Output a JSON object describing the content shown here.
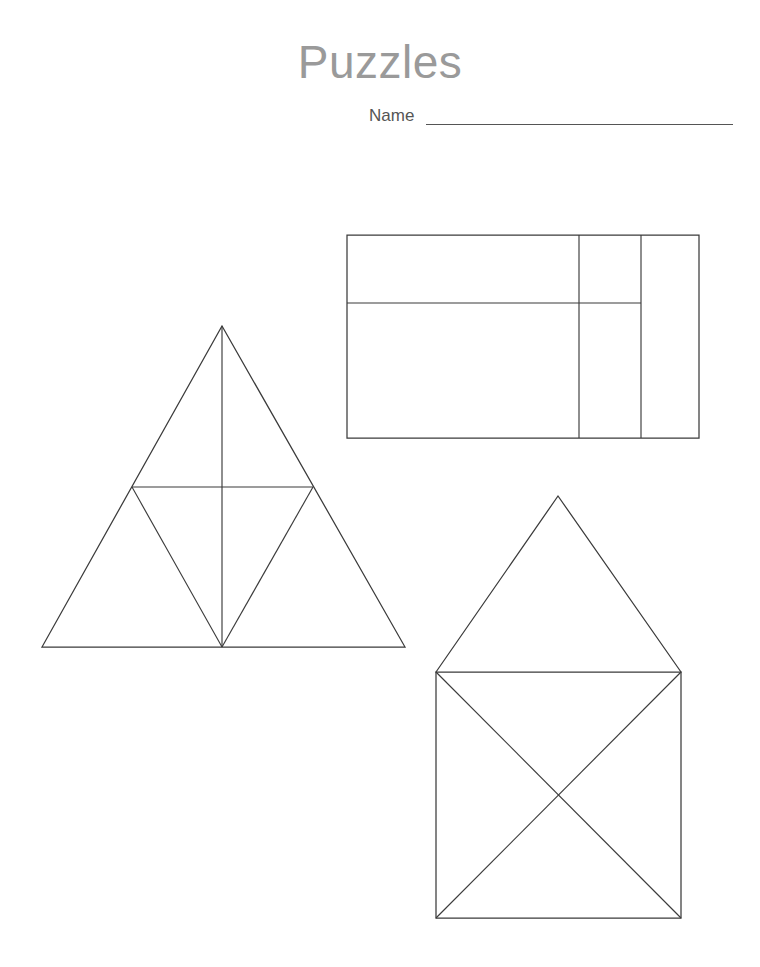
{
  "page": {
    "width": 760,
    "height": 967,
    "background_color": "#ffffff",
    "title": "Puzzles",
    "title_color": "#9a9a9a"
  },
  "header": {
    "title": "Puzzles",
    "name_label": "Name",
    "name_value": "",
    "name_line_color": "#555555"
  },
  "styles": {
    "line_color": "#3b3b3b",
    "title_color": "#9a9a9a",
    "label_color": "#555555"
  },
  "figures": [
    {
      "id": "triangle-puzzle",
      "name": "triangle-puzzle",
      "kind": "triangle",
      "description": "Large triangle divided into four smaller triangles by midsegments, plus a vertical altitude from apex to base midpoint",
      "outline": [
        [
          222,
          326
        ],
        [
          405,
          647
        ],
        [
          42,
          647
        ]
      ],
      "cut_lines": [
        [
          [
            132,
            487
          ],
          [
            313,
            487
          ]
        ],
        [
          [
            132,
            487
          ],
          [
            222,
            647
          ]
        ],
        [
          [
            313,
            487
          ],
          [
            222,
            647
          ]
        ],
        [
          [
            222,
            326
          ],
          [
            222,
            647
          ]
        ]
      ],
      "piece_count": 5
    },
    {
      "id": "rectangle-puzzle",
      "name": "rectangle-puzzle",
      "kind": "rectangle",
      "description": "Rectangle divided by two full-height vertical lines and one horizontal line that stops at the second vertical",
      "outline": [
        [
          347,
          235
        ],
        [
          699,
          235
        ],
        [
          699,
          438
        ],
        [
          347,
          438
        ]
      ],
      "cut_lines": [
        [
          [
            579,
            235
          ],
          [
            579,
            438
          ]
        ],
        [
          [
            641,
            235
          ],
          [
            641,
            438
          ]
        ],
        [
          [
            347,
            303
          ],
          [
            641,
            303
          ]
        ]
      ],
      "piece_count": 5
    },
    {
      "id": "house-puzzle",
      "name": "house-puzzle",
      "kind": "house",
      "description": "Square crossed by both diagonals with a triangular roof on top",
      "outline": [
        [
          436,
          672
        ],
        [
          681,
          672
        ],
        [
          681,
          918
        ],
        [
          436,
          918
        ]
      ],
      "roof": [
        [
          436,
          672
        ],
        [
          558,
          496
        ],
        [
          681,
          672
        ]
      ],
      "cut_lines": [
        [
          [
            436,
            672
          ],
          [
            681,
            918
          ]
        ],
        [
          [
            681,
            672
          ],
          [
            436,
            918
          ]
        ]
      ],
      "piece_count": 5
    }
  ]
}
